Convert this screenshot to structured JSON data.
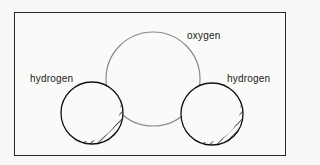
{
  "diagram": {
    "title": "",
    "atoms": [
      {
        "id": "oxygen",
        "label": "oxygen",
        "cx": 153,
        "cy": 79,
        "r": 47,
        "stroke": "#8a8a8a"
      },
      {
        "id": "hydrogen-left",
        "label": "hydrogen",
        "cx": 92,
        "cy": 113,
        "r": 31,
        "stroke": "#111111"
      },
      {
        "id": "hydrogen-right",
        "label": "hydrogen",
        "cx": 212,
        "cy": 114,
        "r": 31,
        "stroke": "#111111"
      }
    ],
    "labels": {
      "oxygen": "oxygen",
      "hydrogen_left": "hydrogen",
      "hydrogen_right": "hydrogen"
    },
    "style": {
      "oxygen_color": "#8a8a8a",
      "hydrogen_color": "#111111",
      "frame_color": "#2a2a2a",
      "shading": "diagonal hatching on lower-right side"
    }
  }
}
